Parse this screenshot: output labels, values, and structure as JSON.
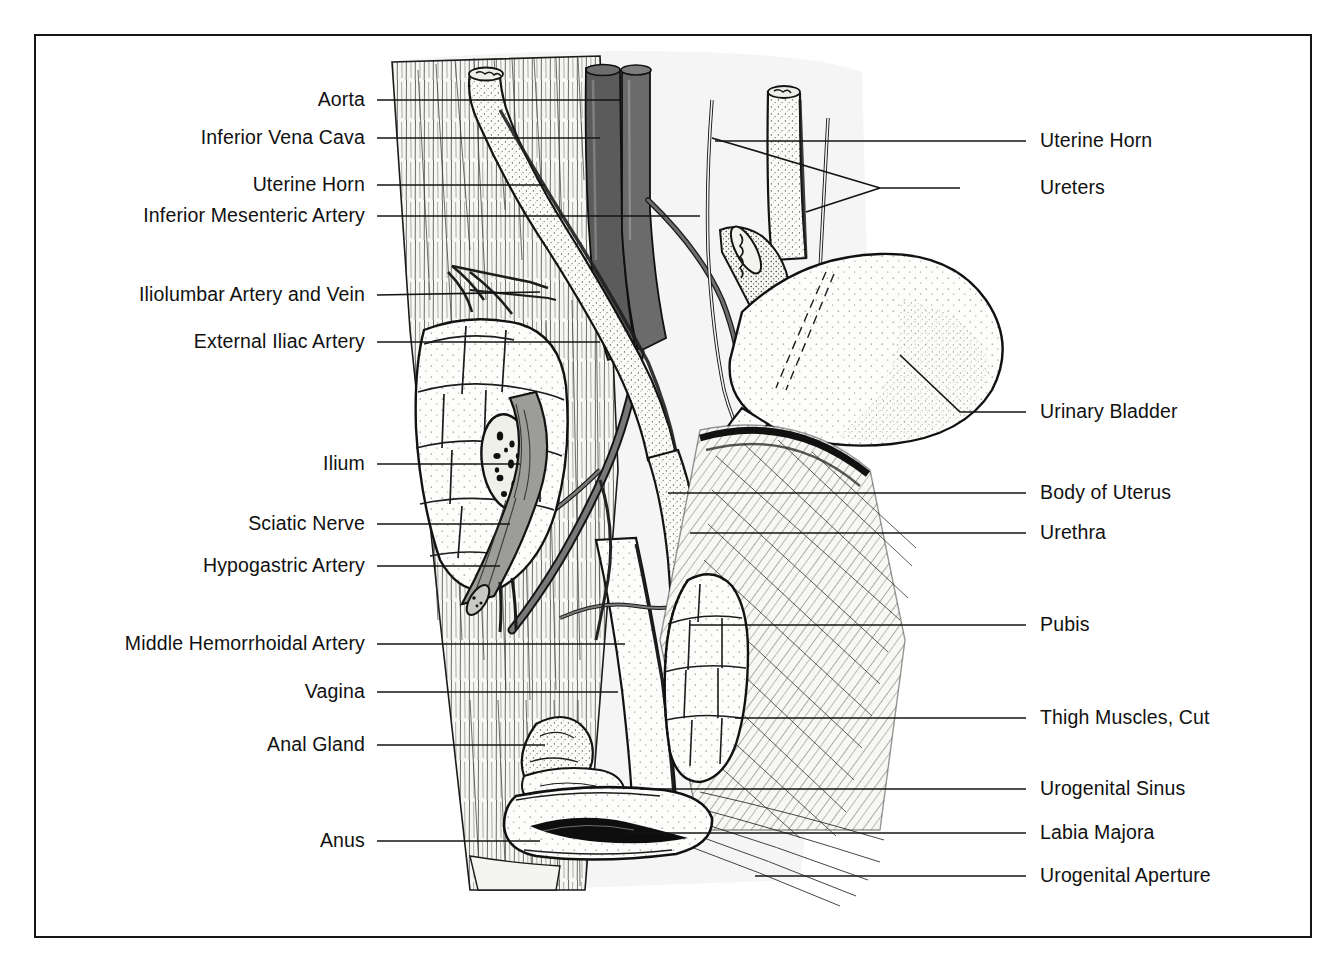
{
  "figure": {
    "style": "pen-and-ink stippled medical illustration",
    "frame_color": "#151515",
    "background_color": "#ffffff",
    "ink_color": "#111111"
  },
  "labels_left": [
    {
      "id": "aorta",
      "text": "Aorta",
      "x": 365,
      "y": 100,
      "leader_to_x": 620,
      "leader_to_y": 100
    },
    {
      "id": "inferior-vena-cava",
      "text": "Inferior Vena Cava",
      "x": 365,
      "y": 138,
      "leader_to_x": 600,
      "leader_to_y": 138
    },
    {
      "id": "uterine-horn-left",
      "text": "Uterine Horn",
      "x": 365,
      "y": 185,
      "leader_to_x": 545,
      "leader_to_y": 185
    },
    {
      "id": "inferior-mesenteric-artery",
      "text": "Inferior Mesenteric Artery",
      "x": 365,
      "y": 216,
      "leader_to_x": 700,
      "leader_to_y": 216
    },
    {
      "id": "iliolumbar-artery-and-vein",
      "text": "Iliolumbar Artery and Vein",
      "x": 365,
      "y": 295,
      "leader_to_x": 540,
      "leader_to_y": 292
    },
    {
      "id": "external-iliac-artery",
      "text": "External Iliac Artery",
      "x": 365,
      "y": 342,
      "leader_to_x": 600,
      "leader_to_y": 342
    },
    {
      "id": "ilium",
      "text": "Ilium",
      "x": 365,
      "y": 464,
      "leader_to_x": 520,
      "leader_to_y": 464
    },
    {
      "id": "sciatic-nerve",
      "text": "Sciatic Nerve",
      "x": 365,
      "y": 524,
      "leader_to_x": 510,
      "leader_to_y": 524
    },
    {
      "id": "hypogastric-artery",
      "text": "Hypogastric Artery",
      "x": 365,
      "y": 566,
      "leader_to_x": 500,
      "leader_to_y": 566
    },
    {
      "id": "middle-hemorrhoidal-artery",
      "text": "Middle Hemorrhoidal Artery",
      "x": 365,
      "y": 644,
      "leader_to_x": 625,
      "leader_to_y": 644
    },
    {
      "id": "vagina",
      "text": "Vagina",
      "x": 365,
      "y": 692,
      "leader_to_x": 618,
      "leader_to_y": 692
    },
    {
      "id": "anal-gland",
      "text": "Anal Gland",
      "x": 365,
      "y": 745,
      "leader_to_x": 545,
      "leader_to_y": 745
    },
    {
      "id": "anus",
      "text": "Anus",
      "x": 365,
      "y": 841,
      "leader_to_x": 540,
      "leader_to_y": 841
    }
  ],
  "labels_right": [
    {
      "id": "uterine-horn-right",
      "text": "Uterine Horn",
      "x": 1040,
      "y": 141,
      "leader_to_x": 715,
      "leader_to_y": 141
    },
    {
      "id": "ureters",
      "text": "Ureters",
      "x": 1040,
      "y": 188,
      "leader_to_x": 720,
      "leader_to_y": 188
    },
    {
      "id": "urinary-bladder",
      "text": "Urinary Bladder",
      "x": 1040,
      "y": 412,
      "leader_to_x": 900,
      "leader_to_y": 355
    },
    {
      "id": "body-of-uterus",
      "text": "Body of Uterus",
      "x": 1040,
      "y": 493,
      "leader_to_x": 668,
      "leader_to_y": 493
    },
    {
      "id": "urethra",
      "text": "Urethra",
      "x": 1040,
      "y": 533,
      "leader_to_x": 690,
      "leader_to_y": 533
    },
    {
      "id": "pubis",
      "text": "Pubis",
      "x": 1040,
      "y": 625,
      "leader_to_x": 690,
      "leader_to_y": 625
    },
    {
      "id": "thigh-muscles-cut",
      "text": "Thigh Muscles, Cut",
      "x": 1040,
      "y": 718,
      "leader_to_x": 735,
      "leader_to_y": 718
    },
    {
      "id": "urogenital-sinus",
      "text": "Urogenital Sinus",
      "x": 1040,
      "y": 789,
      "leader_to_x": 640,
      "leader_to_y": 789
    },
    {
      "id": "labia-majora",
      "text": "Labia Majora",
      "x": 1040,
      "y": 833,
      "leader_to_x": 628,
      "leader_to_y": 833
    },
    {
      "id": "urogenital-aperture",
      "text": "Urogenital Aperture",
      "x": 1040,
      "y": 876,
      "leader_to_x": 755,
      "leader_to_y": 876
    }
  ],
  "structures": [
    {
      "name": "aorta",
      "shading": "dark-gray-tube",
      "color": "#6f6f6f"
    },
    {
      "name": "inferior-vena-cava",
      "shading": "dark-gray-tube",
      "color": "#5e5e5e"
    },
    {
      "name": "uterine-horn",
      "shading": "stippled-tube",
      "color": "#f2f2ee"
    },
    {
      "name": "ureter",
      "shading": "thin-line-tube",
      "color": "#e8e8e4"
    },
    {
      "name": "urinary-bladder",
      "shading": "stippled-oval",
      "color": "#f7f7f3"
    },
    {
      "name": "ilium",
      "shading": "lobed-stipple-bone",
      "color": "#f1f1ec"
    },
    {
      "name": "pubis",
      "shading": "lobed-stipple-bone",
      "color": "#f1f1ec"
    },
    {
      "name": "sciatic-nerve",
      "shading": "banded-gray-cord",
      "color": "#9a9a96"
    },
    {
      "name": "thigh-muscles-cut",
      "shading": "diagonal-hatching",
      "color": "#f0f0ec"
    },
    {
      "name": "lumbar-muscle",
      "shading": "vertical-striation",
      "color": "#f3f3ef"
    },
    {
      "name": "vagina",
      "shading": "stippled-canal",
      "color": "#f4f4f0"
    },
    {
      "name": "anal-gland",
      "shading": "stippled-lobe",
      "color": "#efefe9"
    },
    {
      "name": "labia-majora",
      "shading": "stippled-fold",
      "color": "#f2f2ed"
    }
  ]
}
